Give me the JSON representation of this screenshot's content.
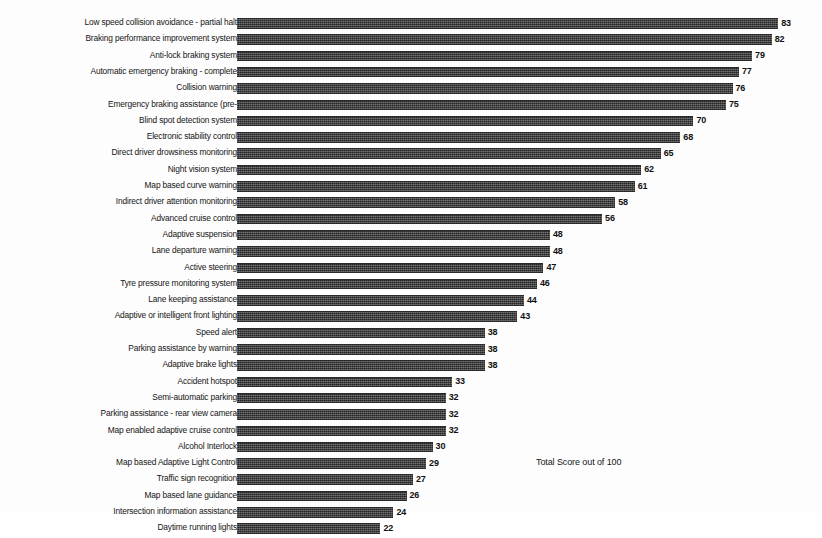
{
  "chart_data": {
    "type": "bar",
    "orientation": "horizontal",
    "title": "",
    "subtitle": "",
    "xlabel": "",
    "ylabel": "",
    "xlim": [
      0,
      100
    ],
    "grid": false,
    "legend": null,
    "annotations": [
      {
        "text": "Total Score out of 100",
        "x": 536,
        "y": 457
      }
    ],
    "categories": [
      "Low speed collision avoidance - partial halt",
      "Braking performance improvement system",
      "Anti-lock braking system",
      "Automatic emergency braking - complete",
      "Collision warning",
      "Emergency braking assistance (pre-",
      "Blind spot detection system",
      "Electronic stability control",
      "Direct driver drowsiness monitoring",
      "Night vision system",
      "Map based curve warning",
      "Indirect driver attention monitoring",
      "Advanced cruise control",
      "Adaptive suspension",
      "Lane departure warning",
      "Active steering",
      "Tyre pressure monitoring system",
      "Lane keeping assistance",
      "Adaptive or intelligent front lighting",
      "Speed alert",
      "Parking assistance by warning",
      "Adaptive brake lights",
      "Accident hotspot",
      "Semi-automatic parking",
      "Parking assistance - rear view camera",
      "Map enabled adaptive cruise control",
      "Alcohol Interlock",
      "Map based Adaptive Light Control",
      "Traffic sign recognition",
      "Map based lane guidance",
      "Intersection information assistance",
      "Daytime running lights"
    ],
    "values": [
      83,
      82,
      79,
      77,
      76,
      75,
      70,
      68,
      65,
      62,
      61,
      58,
      56,
      48,
      48,
      47,
      46,
      44,
      43,
      38,
      38,
      38,
      33,
      32,
      32,
      32,
      30,
      29,
      27,
      26,
      24,
      22
    ],
    "value_labels": [
      "83",
      "82",
      "79",
      "77",
      "76",
      "75",
      "70",
      "68",
      "65",
      "62",
      "61",
      "58",
      "56",
      "48",
      "48",
      "47",
      "46",
      "44",
      "43",
      "38",
      "38",
      "38",
      "33",
      "32",
      "32",
      "32",
      "30",
      "29",
      "27",
      "26",
      "24",
      "22"
    ],
    "bar_color": "#3a3a3a"
  },
  "layout": {
    "bar_origin_px": 237,
    "px_per_unit": 6.52,
    "row_pitch_px": 16.3,
    "first_row_top_px": 17
  }
}
